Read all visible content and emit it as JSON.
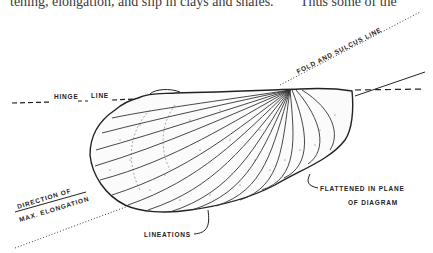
{
  "page": {
    "top_text_left": "tening, elongation, and slip in clays and shales.",
    "top_text_right": "Thus some of the"
  },
  "figure": {
    "type": "line-drawing",
    "labels": {
      "hinge_line_a": "HINGE",
      "hinge_line_b": "LINE",
      "fold_sulcus": "FOLD AND SULCUS LINE",
      "direction_1": "DIRECTION OF",
      "direction_2": "MAX. ELONGATION",
      "flattened_1": "FLATTENED IN PLANE",
      "flattened_2": "OF DIAGRAM",
      "lineations": "LINEATIONS"
    },
    "colors": {
      "ink": "#222222",
      "paper": "#ffffff"
    }
  }
}
